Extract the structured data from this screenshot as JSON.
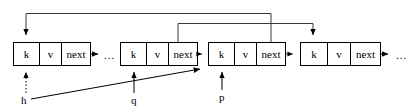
{
  "diagram": {
    "colors": {
      "stroke": "#000000",
      "stroke_light": "#3a3a3a",
      "background": "#ffffff",
      "text": "#000000"
    },
    "cell_labels": {
      "key": "k",
      "value": "v",
      "next": "next"
    },
    "nodes": [
      {
        "id": "node-1",
        "x": 13,
        "y": 42,
        "width": 77,
        "height": 23,
        "cells": [
          "k",
          "v",
          "next"
        ],
        "cell_splits": [
          26,
          48
        ]
      },
      {
        "id": "node-2",
        "x": 120,
        "y": 42,
        "width": 77,
        "height": 23,
        "cells": [
          "k",
          "v",
          "next"
        ],
        "cell_splits": [
          26,
          48
        ]
      },
      {
        "id": "node-3",
        "x": 208,
        "y": 42,
        "width": 77,
        "height": 23,
        "cells": [
          "k",
          "v",
          "next"
        ],
        "cell_splits": [
          26,
          48
        ]
      },
      {
        "id": "node-4",
        "x": 300,
        "y": 42,
        "width": 80,
        "height": 23,
        "cells": [
          "k",
          "v",
          "next"
        ],
        "cell_splits": [
          27,
          50
        ]
      }
    ],
    "ellipses": [
      {
        "id": "ellipsis-after-node-1",
        "text": "...",
        "x": 104,
        "y": 58
      },
      {
        "id": "ellipsis-after-node-4",
        "text": "...",
        "x": 396,
        "y": 58
      }
    ],
    "pointers": [
      {
        "id": "pointer-h",
        "label": "h",
        "x": 21,
        "y": 101,
        "style": "dotted",
        "target": "node-1"
      },
      {
        "id": "pointer-q",
        "label": "q",
        "x": 132,
        "y": 101,
        "style": "solid",
        "target": "node-2"
      },
      {
        "id": "pointer-p",
        "label": "p",
        "x": 220,
        "y": 99,
        "style": "solid",
        "target": "node-3"
      }
    ],
    "links": [
      {
        "id": "link-node1-next",
        "style": "solid",
        "from": "node-1.next",
        "to": "ellipsis"
      },
      {
        "id": "link-node2-next",
        "style": "dotted",
        "from": "node-2.next",
        "to": "node-3"
      },
      {
        "id": "link-node3-next",
        "style": "dotted",
        "from": "node-3.next",
        "to": "node-4"
      },
      {
        "id": "link-node4-next",
        "style": "solid",
        "from": "node-4.next",
        "to": "ellipsis"
      },
      {
        "id": "link-back-node3-to-node1",
        "style": "solid",
        "from": "node-3.next",
        "to": "node-1.head",
        "route": "top",
        "y": 13
      },
      {
        "id": "link-back-node2-to-node4",
        "style": "solid",
        "from": "node-2.next",
        "to": "node-4.head",
        "route": "top",
        "y": 23
      },
      {
        "id": "link-diagonal-h-to-node3",
        "style": "solid",
        "from": "pointer-h",
        "to": "node-3"
      }
    ]
  }
}
